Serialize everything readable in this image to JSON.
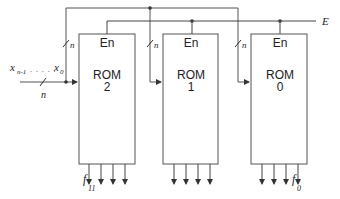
{
  "diagram": {
    "enable_line_label": "E",
    "input_label": {
      "main": "x",
      "first_sub": "n-1",
      "dots": ". . . . .",
      "last_main": "x",
      "last_sub": "0"
    },
    "bus_width_label": "n",
    "roms": [
      {
        "en_label": "En",
        "name": "ROM",
        "index": "2"
      },
      {
        "en_label": "En",
        "name": "ROM",
        "index": "1"
      },
      {
        "en_label": "En",
        "name": "ROM",
        "index": "0"
      }
    ],
    "outputs": {
      "left_label_main": "f",
      "left_label_sub": "11",
      "right_label_main": "f",
      "right_label_sub": "0"
    },
    "colors": {
      "line": "#444444",
      "box": "#555555",
      "text": "#222222"
    }
  }
}
